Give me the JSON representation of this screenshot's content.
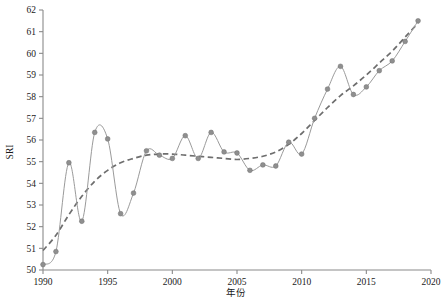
{
  "chart_data": {
    "type": "line",
    "title": "",
    "xlabel": "年份",
    "ylabel": "SRI",
    "xlim": [
      1990,
      2020
    ],
    "ylim": [
      50,
      62
    ],
    "grid": false,
    "legend": "none",
    "xticks": [
      1990,
      1995,
      2000,
      2005,
      2010,
      2015,
      2020
    ],
    "yticks": [
      50,
      51,
      52,
      53,
      54,
      55,
      56,
      57,
      58,
      59,
      60,
      61,
      62
    ],
    "x": [
      1990,
      1991,
      1992,
      1993,
      1994,
      1995,
      1996,
      1997,
      1998,
      1999,
      2000,
      2001,
      2002,
      2003,
      2004,
      2005,
      2006,
      2007,
      2008,
      2009,
      2010,
      2011,
      2012,
      2013,
      2014,
      2015,
      2016,
      2017,
      2018,
      2019
    ],
    "series": [
      {
        "name": "SRI",
        "style": "solid-with-markers",
        "color": "#9a9a9a",
        "values": [
          50.25,
          50.85,
          54.95,
          52.25,
          56.35,
          56.05,
          52.6,
          53.55,
          55.5,
          55.3,
          55.15,
          56.2,
          55.15,
          56.35,
          55.45,
          55.4,
          54.6,
          54.85,
          54.8,
          55.9,
          55.35,
          57.0,
          58.35,
          59.4,
          58.1,
          58.45,
          59.2,
          59.65,
          60.55,
          61.5
        ]
      },
      {
        "name": "趋势线",
        "style": "dashed",
        "color": "#6e6e6e",
        "values": [
          50.9,
          51.6,
          52.55,
          53.4,
          54.1,
          54.6,
          54.95,
          55.15,
          55.3,
          55.35,
          55.35,
          55.3,
          55.25,
          55.2,
          55.15,
          55.1,
          55.15,
          55.25,
          55.45,
          55.8,
          56.3,
          56.9,
          57.5,
          58.05,
          58.5,
          59.0,
          59.55,
          60.1,
          60.75,
          61.4
        ]
      }
    ]
  },
  "axes": {
    "y_title": "SRI",
    "x_title": "年份"
  }
}
